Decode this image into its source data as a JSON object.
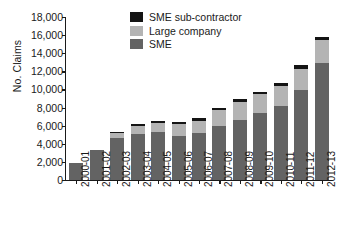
{
  "chart_data": {
    "type": "bar",
    "subtype": "stacked-bar",
    "title": "",
    "xlabel": "",
    "ylabel": "No. Claims",
    "ylim": [
      0,
      18000
    ],
    "ytick_values": [
      0,
      2000,
      4000,
      6000,
      8000,
      10000,
      12000,
      14000,
      16000,
      18000
    ],
    "ytick_labels": [
      "0",
      "2,000",
      "4,000",
      "6,000",
      "8,000",
      "10,000",
      "12,000",
      "14,000",
      "16,000",
      "18,000"
    ],
    "grid": false,
    "legend_position": "top-center",
    "categories": [
      "2000-01",
      "2001-02",
      "2002-03",
      "2003-04",
      "2004-05",
      "2005-06",
      "2006-07",
      "2007-08",
      "2008-09",
      "2009-10",
      "2010-11",
      "2011-12",
      "2012-13"
    ],
    "series": [
      {
        "name": "SME",
        "color": "#636363",
        "values": [
          1900,
          3350,
          4600,
          5100,
          5300,
          4900,
          5200,
          5950,
          6600,
          7400,
          8200,
          9950,
          12900
        ]
      },
      {
        "name": "Large company",
        "color": "#b4b4b4",
        "values": [
          0,
          0,
          600,
          900,
          1050,
          1250,
          1350,
          1750,
          2050,
          2050,
          2150,
          2350,
          2600
        ]
      },
      {
        "name": "SME sub-contractor",
        "color": "#141414",
        "values": [
          0,
          0,
          100,
          150,
          200,
          250,
          300,
          300,
          300,
          300,
          350,
          350,
          300
        ]
      }
    ],
    "totals": [
      1900,
      3350,
      5300,
      6150,
      6550,
      6400,
      6850,
      8000,
      8950,
      9750,
      10700,
      12650,
      15800
    ]
  },
  "legend": {
    "items": [
      {
        "label": "SME sub-contractor",
        "color": "#141414"
      },
      {
        "label": "Large company",
        "color": "#b4b4b4"
      },
      {
        "label": "SME",
        "color": "#636363"
      }
    ]
  }
}
